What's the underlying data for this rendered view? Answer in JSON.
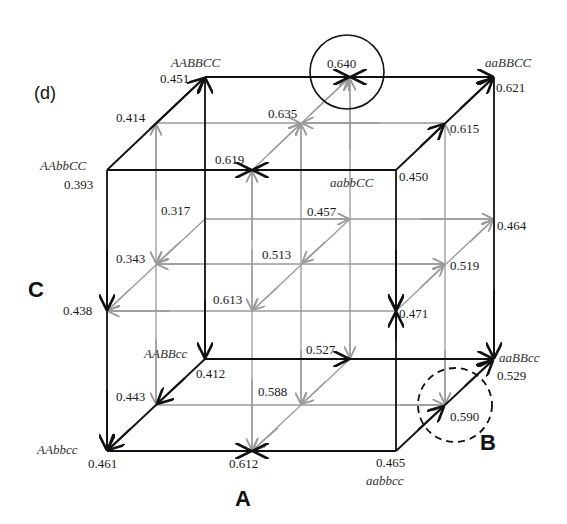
{
  "panel_label": "(d)",
  "axes": {
    "A": "A",
    "B": "B",
    "C": "C"
  },
  "colors": {
    "outer_edge": "#111111",
    "inner_edge": "#9a9a9a",
    "highlight_circle": "#111111"
  },
  "genotype_labels": {
    "AABBCC": "AABBCC",
    "aaBBCC": "aaBBCC",
    "AAbbCC": "AAbbCC",
    "aabbCC": "aabbCC",
    "AABBcc": "AABBcc",
    "aaBBcc": "aaBBcc",
    "AAbbcc": "AAbbcc",
    "aabbcc": "aabbcc"
  },
  "nodes": {
    "n022": "0.451",
    "n122": "0.640",
    "n222": "0.621",
    "n012": "0.414",
    "n112": "0.635",
    "n212": "0.615",
    "n002": "0.393",
    "n102": "0.619",
    "n202": "0.450",
    "n021": "0.317",
    "n121": "0.457",
    "n221": "0.464",
    "n011": "0.343",
    "n111": "0.513",
    "n211": "0.519",
    "n001": "0.438",
    "n101": "0.613",
    "n201": "0.471",
    "n020": "0.412",
    "n120": "0.527",
    "n220": "0.529",
    "n010": "0.443",
    "n110": "0.588",
    "n210": "0.590",
    "n000": "0.461",
    "n100": "0.612",
    "n200": "0.465"
  },
  "highlights": {
    "solid_circle_node": "0.640",
    "dashed_circle_node": "0.590"
  }
}
